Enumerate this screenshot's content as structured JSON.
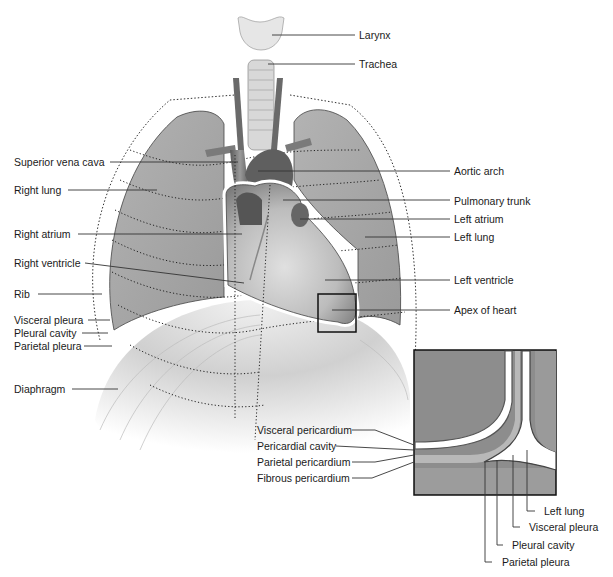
{
  "diagram": {
    "colors": {
      "lung": "#a9a9a9",
      "lung_dark": "#8f8f8f",
      "heart": "#bdbdbd",
      "heart_dark": "#6e6e6e",
      "diaphragm": "#c8c8c8",
      "membrane": "#ffffff",
      "outline": "#4a4a4a",
      "leader": "#333333",
      "inset_bg": "#8a8a8a"
    },
    "labels_left": [
      {
        "id": "superior-vena-cava",
        "text": "Superior vena cava"
      },
      {
        "id": "right-lung",
        "text": "Right lung"
      },
      {
        "id": "right-atrium",
        "text": "Right atrium"
      },
      {
        "id": "right-ventricle",
        "text": "Right ventricle"
      },
      {
        "id": "rib",
        "text": "Rib"
      },
      {
        "id": "visceral-pleura",
        "text": "Visceral pleura"
      },
      {
        "id": "pleural-cavity",
        "text": "Pleural cavity"
      },
      {
        "id": "parietal-pleura",
        "text": "Parietal pleura"
      },
      {
        "id": "diaphragm",
        "text": "Diaphragm"
      }
    ],
    "labels_right": [
      {
        "id": "larynx",
        "text": "Larynx"
      },
      {
        "id": "trachea",
        "text": "Trachea"
      },
      {
        "id": "aortic-arch",
        "text": "Aortic arch"
      },
      {
        "id": "pulmonary-trunk",
        "text": "Pulmonary trunk"
      },
      {
        "id": "left-atrium",
        "text": "Left atrium"
      },
      {
        "id": "left-lung",
        "text": "Left lung"
      },
      {
        "id": "left-ventricle",
        "text": "Left ventricle"
      },
      {
        "id": "apex-of-heart",
        "text": "Apex of heart"
      }
    ],
    "inset_labels_left": [
      {
        "id": "visceral-pericardium",
        "text": "Visceral pericardium"
      },
      {
        "id": "pericardial-cavity",
        "text": "Pericardial cavity"
      },
      {
        "id": "parietal-pericardium",
        "text": "Parietal pericardium"
      },
      {
        "id": "fibrous-pericardium",
        "text": "Fibrous pericardium"
      }
    ],
    "inset_labels_bottom": [
      {
        "id": "inset-left-lung",
        "text": "Left lung"
      },
      {
        "id": "inset-visceral-pleura",
        "text": "Visceral pleura"
      },
      {
        "id": "inset-pleural-cavity",
        "text": "Pleural cavity"
      },
      {
        "id": "inset-parietal-pleura",
        "text": "Parietal pleura"
      }
    ]
  }
}
